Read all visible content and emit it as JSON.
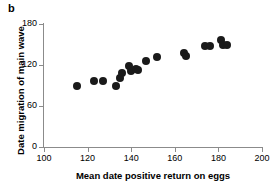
{
  "panel": {
    "label": "b"
  },
  "chart_data": {
    "type": "scatter",
    "title": "",
    "xlabel": "Mean date positive return on eggs",
    "ylabel": "Date migration of main wave",
    "xlim": [
      100,
      200
    ],
    "ylim": [
      0,
      180
    ],
    "xticks": [
      100,
      120,
      140,
      160,
      180,
      200
    ],
    "yticks": [
      0,
      60,
      120,
      180
    ],
    "grid": false,
    "legend": null,
    "marker": {
      "shape": "circle",
      "color": "#1a1a1a",
      "size_px": 8
    },
    "points": [
      {
        "x": 115,
        "y": 90
      },
      {
        "x": 123,
        "y": 97
      },
      {
        "x": 127,
        "y": 97
      },
      {
        "x": 133,
        "y": 90
      },
      {
        "x": 135,
        "y": 101
      },
      {
        "x": 136,
        "y": 108
      },
      {
        "x": 139,
        "y": 118
      },
      {
        "x": 140,
        "y": 111
      },
      {
        "x": 142,
        "y": 114
      },
      {
        "x": 143,
        "y": 112
      },
      {
        "x": 147,
        "y": 126
      },
      {
        "x": 152,
        "y": 131
      },
      {
        "x": 164,
        "y": 137
      },
      {
        "x": 165,
        "y": 133
      },
      {
        "x": 174,
        "y": 148
      },
      {
        "x": 176,
        "y": 148
      },
      {
        "x": 181,
        "y": 156
      },
      {
        "x": 182,
        "y": 149
      },
      {
        "x": 184,
        "y": 149
      }
    ]
  }
}
